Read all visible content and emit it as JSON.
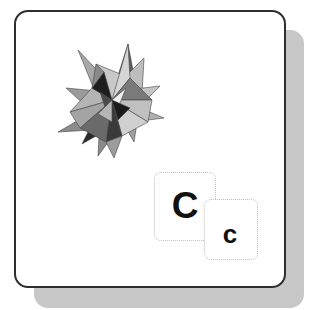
{
  "icon": {
    "name": "compiler-icon",
    "frame_color": "#2e2e2e",
    "shadow_color": "#c8c8c8",
    "polyhedron": "small-stellated-dodecahedron",
    "tiles": [
      {
        "label": "C"
      },
      {
        "label": "c"
      }
    ]
  }
}
